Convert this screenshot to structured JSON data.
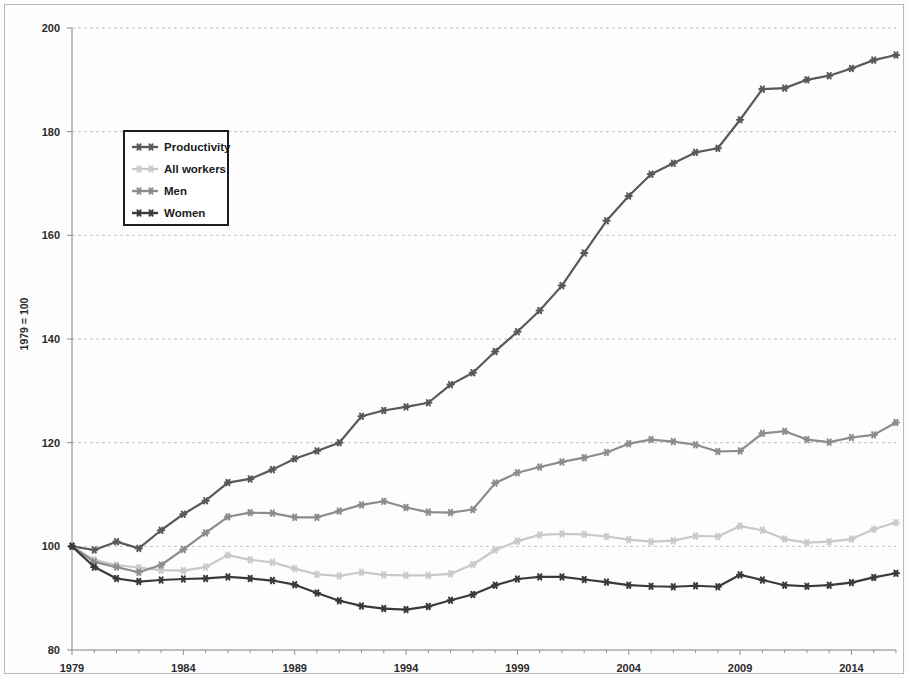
{
  "chart_data": {
    "type": "line",
    "title": "",
    "subtitle": "",
    "xlabel": "",
    "ylabel": "1979 = 100",
    "xlim": [
      1979,
      2016
    ],
    "ylim": [
      80,
      200
    ],
    "ytick_interval": 20,
    "xtick_interval": 1,
    "xtick_label_interval": 5,
    "grid": true,
    "grid_axis": "y",
    "legend_position": "upper-left-inside",
    "yticks": [
      80,
      100,
      120,
      140,
      160,
      180,
      200
    ],
    "ytick_labels": [
      "80",
      "100",
      "120",
      "140",
      "160",
      "180",
      "200"
    ],
    "xticks": [
      1979,
      1984,
      1989,
      1994,
      1999,
      2004,
      2009,
      2014
    ],
    "xtick_labels": [
      "1979",
      "1984",
      "1989",
      "1994",
      "1999",
      "2004",
      "2009",
      "2014"
    ],
    "x": [
      1979,
      1980,
      1981,
      1982,
      1983,
      1984,
      1985,
      1986,
      1987,
      1988,
      1989,
      1990,
      1991,
      1992,
      1993,
      1994,
      1995,
      1996,
      1997,
      1998,
      1999,
      2000,
      2001,
      2002,
      2003,
      2004,
      2005,
      2006,
      2007,
      2008,
      2009,
      2010,
      2011,
      2012,
      2013,
      2014,
      2015,
      2016
    ],
    "series": [
      {
        "name": "Productivity",
        "color": "#595959",
        "marker": "star",
        "linewidth": 2.2,
        "values": [
          100.0,
          99.3,
          100.9,
          99.6,
          103.1,
          106.2,
          108.8,
          112.3,
          113.0,
          114.8,
          116.9,
          118.4,
          120.0,
          125.1,
          126.2,
          126.9,
          127.7,
          131.2,
          133.5,
          137.6,
          141.4,
          145.5,
          150.3,
          156.6,
          162.8,
          167.6,
          171.8,
          173.9,
          176.0,
          176.8,
          182.3,
          188.2,
          188.4,
          190.0,
          190.8,
          192.2,
          193.8,
          194.8
        ]
      },
      {
        "name": "All workers",
        "color": "#c9c9c9",
        "marker": "star",
        "linewidth": 2.2,
        "values": [
          100.0,
          97.4,
          96.4,
          95.9,
          95.4,
          95.3,
          96.0,
          98.3,
          97.4,
          96.9,
          95.7,
          94.6,
          94.3,
          95.0,
          94.5,
          94.4,
          94.4,
          94.7,
          96.5,
          99.3,
          101.0,
          102.2,
          102.4,
          102.3,
          101.9,
          101.3,
          100.9,
          101.1,
          102.0,
          101.9,
          103.9,
          103.1,
          101.4,
          100.7,
          100.9,
          101.4,
          103.3,
          104.6
        ]
      },
      {
        "name": "Men",
        "color": "#8c8c8c",
        "marker": "star",
        "linewidth": 2.2,
        "values": [
          100.0,
          97.0,
          96.0,
          95.0,
          96.4,
          99.4,
          102.6,
          105.7,
          106.5,
          106.4,
          105.6,
          105.6,
          106.8,
          108.0,
          108.7,
          107.5,
          106.6,
          106.5,
          107.1,
          112.2,
          114.2,
          115.3,
          116.3,
          117.1,
          118.1,
          119.8,
          120.6,
          120.2,
          119.6,
          118.3,
          118.4,
          121.8,
          122.2,
          120.6,
          120.1,
          121.0,
          121.5,
          123.9
        ]
      },
      {
        "name": "Women",
        "color": "#3a3a3a",
        "marker": "star",
        "linewidth": 2.2,
        "values": [
          100.0,
          96.0,
          93.8,
          93.2,
          93.5,
          93.7,
          93.8,
          94.1,
          93.8,
          93.4,
          92.6,
          91.0,
          89.5,
          88.5,
          88.0,
          87.8,
          88.4,
          89.6,
          90.7,
          92.5,
          93.7,
          94.1,
          94.1,
          93.6,
          93.1,
          92.5,
          92.3,
          92.2,
          92.4,
          92.2,
          94.5,
          93.5,
          92.5,
          92.3,
          92.5,
          93.0,
          94.0,
          94.8
        ]
      }
    ]
  },
  "legend": {
    "entries": [
      {
        "label": "Productivity"
      },
      {
        "label": "All workers"
      },
      {
        "label": "Men"
      },
      {
        "label": "Women"
      }
    ]
  },
  "axis": {
    "y_title": "1979 = 100"
  }
}
